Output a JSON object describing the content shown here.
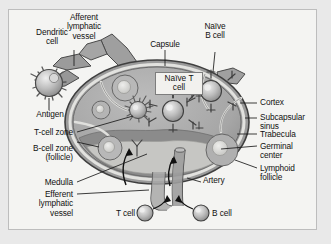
{
  "figure": {
    "type": "anatomical-diagram",
    "style": "grayscale",
    "background_color": "#e9e9e9",
    "panel_color": "#f4f4f2",
    "border_color": "#bdbdbd"
  },
  "labels": {
    "dendritic_cell": "Dendritic\ncell",
    "afferent_lymphatic_vessel": "Afferent\nlymphatic\nvessel",
    "capsule": "Capsule",
    "naive_b_cell": "Naïve\nB cell",
    "naive_t_cell": "Naïve\nT cell",
    "antigen": "Antigen",
    "t_cell_zone": "T-cell zone",
    "b_cell_zone": "B-cell zone\n(follicle)",
    "medulla": "Medulla",
    "efferent_lymphatic_vessel": "Efferent\nlymphatic\nvessel",
    "cortex": "Cortex",
    "subcapsular_sinus": "Subcapsular\nsinus",
    "trabecula": "Trabecula",
    "germinal_center": "Germinal\ncenter",
    "lymphoid_follicle": "Lymphoid\nfollicle",
    "artery": "Artery",
    "t_cell_legend": "T cell",
    "b_cell_legend": "B cell"
  },
  "colors": {
    "node_cortex": "#a9a9a9",
    "node_medulla": "#8e8e8e",
    "node_sinus": "#c9c9c6",
    "vessel": "#9b9b9b",
    "cell_body": "#b4b4b4",
    "cell_highlight": "#e4e4e4",
    "outline": "#4a4a4a",
    "leader_line": "#1a1a1a",
    "germinal_center": "#d8d8d5"
  },
  "structures": [
    {
      "name": "lymph-node-body",
      "shape": "oval"
    },
    {
      "name": "capsule",
      "shape": "outer-ring"
    },
    {
      "name": "subcapsular-sinus",
      "shape": "inner-ring"
    },
    {
      "name": "cortex",
      "shape": "outer-zone"
    },
    {
      "name": "medulla",
      "shape": "central-lower-zone"
    },
    {
      "name": "lymphoid-follicle",
      "count": 4
    },
    {
      "name": "germinal-center",
      "count": 4
    },
    {
      "name": "trabecula",
      "count": 3
    },
    {
      "name": "afferent-lymphatic-vessel",
      "count": 3
    },
    {
      "name": "efferent-lymphatic-vessel",
      "count": 1
    },
    {
      "name": "artery",
      "count": 1
    },
    {
      "name": "dendritic-cell",
      "count": 2
    },
    {
      "name": "naive-t-cell",
      "count": 2
    },
    {
      "name": "naive-b-cell",
      "count": 1
    }
  ]
}
